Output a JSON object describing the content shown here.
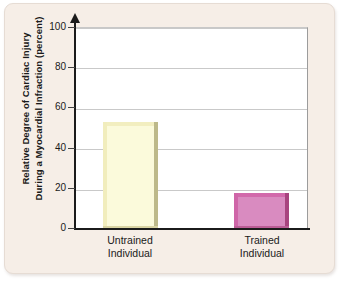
{
  "chart_data": {
    "type": "bar",
    "title": "",
    "subtitle": "",
    "categories": [
      "Untrained Individual",
      "Trained Individual"
    ],
    "category_lines": [
      [
        "Untrained",
        "Individual"
      ],
      [
        "Trained",
        "Individual"
      ]
    ],
    "values": [
      53,
      18
    ],
    "xlabel": "",
    "ylabel": "Relative Degree of Cardiac Injury During a Myocardial Infraction (percent)",
    "ylabel_lines": [
      "Relative Degree of Cardiac Injury",
      "During a Myocardial Infraction (percent)"
    ],
    "ylim": [
      0,
      100
    ],
    "yticks": [
      0,
      20,
      40,
      60,
      80,
      100
    ],
    "ytick_labels": [
      "0",
      "20",
      "40",
      "60",
      "80",
      "100"
    ],
    "grid": true,
    "grid_axis": "y",
    "legend": false,
    "legend_position": "none",
    "bar_colors": [
      "#fbfadb",
      "#d98bc0"
    ],
    "series": [
      {
        "name": "Relative Degree of Cardiac Injury",
        "values": [
          53,
          18
        ]
      }
    ]
  },
  "style": {
    "panel_background": "#f6eee7",
    "plot_background": "#ffffff",
    "axis_color": "#1b1b1b",
    "gridline_color": "#c9c9c9",
    "text_color": "#1a1a1a",
    "untrained_bar_fill": "#fbfadb",
    "untrained_bar_shadow": "#bdb98a",
    "trained_bar_fill": "#d98bc0",
    "trained_bar_shadow": "#a8447f"
  }
}
